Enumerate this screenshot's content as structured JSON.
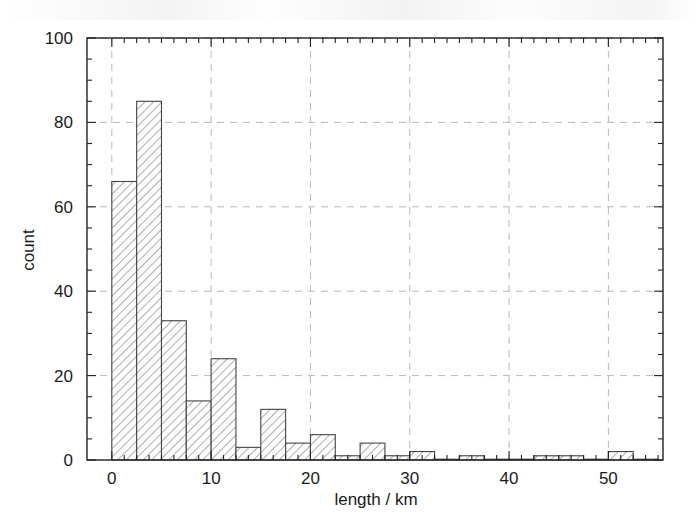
{
  "chart_data": {
    "type": "bar",
    "subtype": "histogram",
    "title": "",
    "xlabel": "length / km",
    "ylabel": "count",
    "xlim": [
      -2.5,
      55.5
    ],
    "ylim": [
      0,
      100
    ],
    "bin_width": 2.5,
    "grid": true,
    "grid_style": "dashed",
    "legend": "none",
    "xticks": [
      0,
      10,
      20,
      30,
      40,
      50
    ],
    "xtick_labels": [
      "0",
      "10",
      "20",
      "30",
      "40",
      "50"
    ],
    "yticks": [
      0,
      20,
      40,
      60,
      80,
      100
    ],
    "ytick_labels": [
      "0",
      "20",
      "40",
      "60",
      "80",
      "100"
    ],
    "x_minor_tick_step": 1.25,
    "y_minor_tick_step": 5,
    "bar_fill": "hatched-diagonal",
    "bar_edge_color": "#444444",
    "bar_hatch_color": "#8a8a8a",
    "background": "#ffffff",
    "bins": [
      {
        "x0": 0.0,
        "x1": 2.5,
        "count": 66
      },
      {
        "x0": 2.5,
        "x1": 5.0,
        "count": 85
      },
      {
        "x0": 5.0,
        "x1": 7.5,
        "count": 33
      },
      {
        "x0": 7.5,
        "x1": 10.0,
        "count": 14
      },
      {
        "x0": 10.0,
        "x1": 12.5,
        "count": 24
      },
      {
        "x0": 12.5,
        "x1": 15.0,
        "count": 3
      },
      {
        "x0": 15.0,
        "x1": 17.5,
        "count": 12
      },
      {
        "x0": 17.5,
        "x1": 20.0,
        "count": 4
      },
      {
        "x0": 20.0,
        "x1": 22.5,
        "count": 6
      },
      {
        "x0": 22.5,
        "x1": 25.0,
        "count": 1
      },
      {
        "x0": 25.0,
        "x1": 27.5,
        "count": 4
      },
      {
        "x0": 27.5,
        "x1": 30.0,
        "count": 1
      },
      {
        "x0": 30.0,
        "x1": 32.5,
        "count": 2
      },
      {
        "x0": 32.5,
        "x1": 35.0,
        "count": 0
      },
      {
        "x0": 35.0,
        "x1": 37.5,
        "count": 1
      },
      {
        "x0": 37.5,
        "x1": 40.0,
        "count": 0
      },
      {
        "x0": 40.0,
        "x1": 42.5,
        "count": 0
      },
      {
        "x0": 42.5,
        "x1": 45.0,
        "count": 1
      },
      {
        "x0": 45.0,
        "x1": 47.5,
        "count": 1
      },
      {
        "x0": 47.5,
        "x1": 50.0,
        "count": 0
      },
      {
        "x0": 50.0,
        "x1": 52.5,
        "count": 2
      },
      {
        "x0": 52.5,
        "x1": 55.0,
        "count": 0
      }
    ],
    "categories": [
      "0-2.5",
      "2.5-5",
      "5-7.5",
      "7.5-10",
      "10-12.5",
      "12.5-15",
      "15-17.5",
      "17.5-20",
      "20-22.5",
      "22.5-25",
      "25-27.5",
      "27.5-30",
      "30-32.5",
      "32.5-35",
      "35-37.5",
      "37.5-40",
      "40-42.5",
      "42.5-45",
      "45-47.5",
      "47.5-50",
      "50-52.5",
      "52.5-55"
    ],
    "values": [
      66,
      85,
      33,
      14,
      24,
      3,
      12,
      4,
      6,
      1,
      4,
      1,
      2,
      0,
      1,
      0,
      0,
      1,
      1,
      0,
      2,
      0
    ]
  }
}
